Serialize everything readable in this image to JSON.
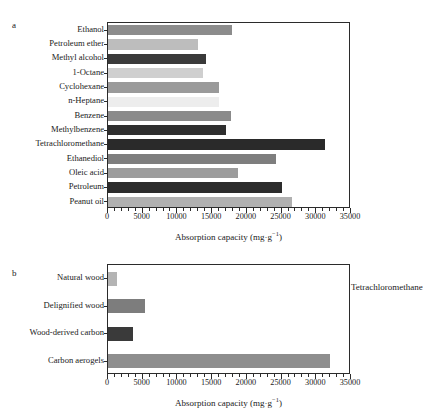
{
  "figure": {
    "panels": [
      {
        "letter": "a",
        "annotation": "",
        "axis_title_main": "Absorption capacity (mg·g",
        "axis_title_sup": "−1",
        "axis_title_close": ")"
      },
      {
        "letter": "b",
        "annotation": "Tetrachloromethane",
        "axis_title_main": "Absorption capacity (mg·g",
        "axis_title_sup": "−1",
        "axis_title_close": ")"
      }
    ]
  },
  "chart_data": [
    {
      "type": "bar",
      "orientation": "horizontal",
      "panel": "a",
      "title": "",
      "xlabel": "Absorption capacity (mg·g−1)",
      "ylabel": "",
      "xlim": [
        0,
        35000
      ],
      "xticks": [
        0,
        5000,
        10000,
        15000,
        20000,
        25000,
        30000,
        35000
      ],
      "xtick_labels": [
        "0",
        "5000",
        "10000",
        "15000",
        "20000",
        "25000",
        "30000",
        "35000"
      ],
      "minor_tick_interval": 1000,
      "grid": false,
      "legend": false,
      "categories": [
        "Ethanol",
        "Petroleum ether",
        "Methyl alcohol",
        "1-Octane",
        "Cyclohexane",
        "n-Heptane",
        "Benzene",
        "Methylbenzene",
        "Tetrachloromethane",
        "Ethanediol",
        "Oleic acid",
        "Petroleum",
        "Peanut oil"
      ],
      "values": [
        18000,
        13100,
        14200,
        13800,
        16100,
        16100,
        17800,
        17200,
        31500,
        24400,
        18900,
        25200,
        26700
      ],
      "bar_colors": [
        "#8c8c8c",
        "#bdbdbd",
        "#3a3a3a",
        "#cfcfcf",
        "#9a9a9a",
        "#ededed",
        "#8a8a8a",
        "#2f2f2f",
        "#2a2a2a",
        "#7e7e7e",
        "#9c9c9c",
        "#2c2c2c",
        "#b0b0b0"
      ]
    },
    {
      "type": "bar",
      "orientation": "horizontal",
      "panel": "b",
      "title": "",
      "xlabel": "Absorption capacity (mg·g−1)",
      "ylabel": "",
      "annotation": "Tetrachloromethane",
      "xlim": [
        0,
        35000
      ],
      "xticks": [
        0,
        5000,
        10000,
        15000,
        20000,
        25000,
        30000,
        35000
      ],
      "xtick_labels": [
        "0",
        "5000",
        "10000",
        "15000",
        "20000",
        "25000",
        "30000",
        "35000"
      ],
      "minor_tick_interval": 1000,
      "grid": false,
      "legend": false,
      "categories": [
        "Natural wood",
        "Delignified wood",
        "Wood-derived carbon",
        "Carbon aerogels"
      ],
      "values": [
        1300,
        5400,
        3700,
        32300
      ],
      "bar_colors": [
        "#b4b4b4",
        "#7d7d7d",
        "#3a3a3a",
        "#8e8e8e"
      ]
    }
  ]
}
